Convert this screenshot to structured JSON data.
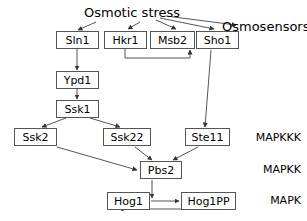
{
  "diagram": {
    "title": "Osmotic stress",
    "sensor_group_label": "Osmosensors",
    "nodes": [
      {
        "id": "sln1",
        "label": "Sln1",
        "x": 56,
        "y": 31,
        "w": 43,
        "h": 18
      },
      {
        "id": "hkr1",
        "label": "Hkr1",
        "x": 104,
        "y": 31,
        "w": 43,
        "h": 18
      },
      {
        "id": "msb2",
        "label": "Msb2",
        "x": 150,
        "y": 31,
        "w": 45,
        "h": 18
      },
      {
        "id": "sho1",
        "label": "Sho1",
        "x": 196,
        "y": 31,
        "w": 43,
        "h": 18
      },
      {
        "id": "ypd1",
        "label": "Ypd1",
        "x": 56,
        "y": 71,
        "w": 43,
        "h": 18
      },
      {
        "id": "ssk1",
        "label": "Ssk1",
        "x": 56,
        "y": 100,
        "w": 43,
        "h": 18
      },
      {
        "id": "ssk2",
        "label": "Ssk2",
        "x": 14,
        "y": 128,
        "w": 43,
        "h": 18
      },
      {
        "id": "ssk22",
        "label": "Ssk22",
        "x": 103,
        "y": 128,
        "w": 48,
        "h": 18
      },
      {
        "id": "ste11",
        "label": "Ste11",
        "x": 185,
        "y": 128,
        "w": 45,
        "h": 18
      },
      {
        "id": "pbs2",
        "label": "Pbs2",
        "x": 140,
        "y": 161,
        "w": 42,
        "h": 18
      },
      {
        "id": "hog1",
        "label": "Hog1",
        "x": 107,
        "y": 192,
        "w": 43,
        "h": 18
      },
      {
        "id": "hog1pp",
        "label": "Hog1PP",
        "x": 181,
        "y": 192,
        "w": 55,
        "h": 18
      }
    ],
    "tiers": [
      {
        "id": "mapkkk",
        "label": "MAPKKK",
        "y": 132
      },
      {
        "id": "mapkk",
        "label": "MAPKK",
        "y": 164
      },
      {
        "id": "mapk",
        "label": "MAPK",
        "y": 195
      }
    ],
    "edges": [
      {
        "from": "osmotic-stress",
        "to": "sln1"
      },
      {
        "from": "osmotic-stress",
        "to": "hkr1"
      },
      {
        "from": "osmotic-stress",
        "to": "msb2"
      },
      {
        "from": "osmotic-stress",
        "to": "sho1"
      },
      {
        "from": "osmotic-stress",
        "to": "osmosensors-label"
      },
      {
        "from": "msb2",
        "to": "sho1"
      },
      {
        "from": "hkr1",
        "to": "sho1"
      },
      {
        "from": "sln1",
        "to": "ypd1"
      },
      {
        "from": "ypd1",
        "to": "ssk1"
      },
      {
        "from": "ssk1",
        "to": "ssk2"
      },
      {
        "from": "ssk1",
        "to": "ssk22"
      },
      {
        "from": "sho1",
        "to": "ste11"
      },
      {
        "from": "ssk2",
        "to": "pbs2"
      },
      {
        "from": "ssk22",
        "to": "pbs2"
      },
      {
        "from": "ste11",
        "to": "pbs2"
      },
      {
        "from": "pbs2",
        "to": "hog1-hog1pp-reaction"
      },
      {
        "from": "hog1",
        "to": "hog1pp"
      },
      {
        "from": "hog1pp",
        "to": "hog1"
      }
    ],
    "colors": {
      "stroke": "#555555",
      "text": "#000000",
      "background": "#ffffff"
    }
  }
}
